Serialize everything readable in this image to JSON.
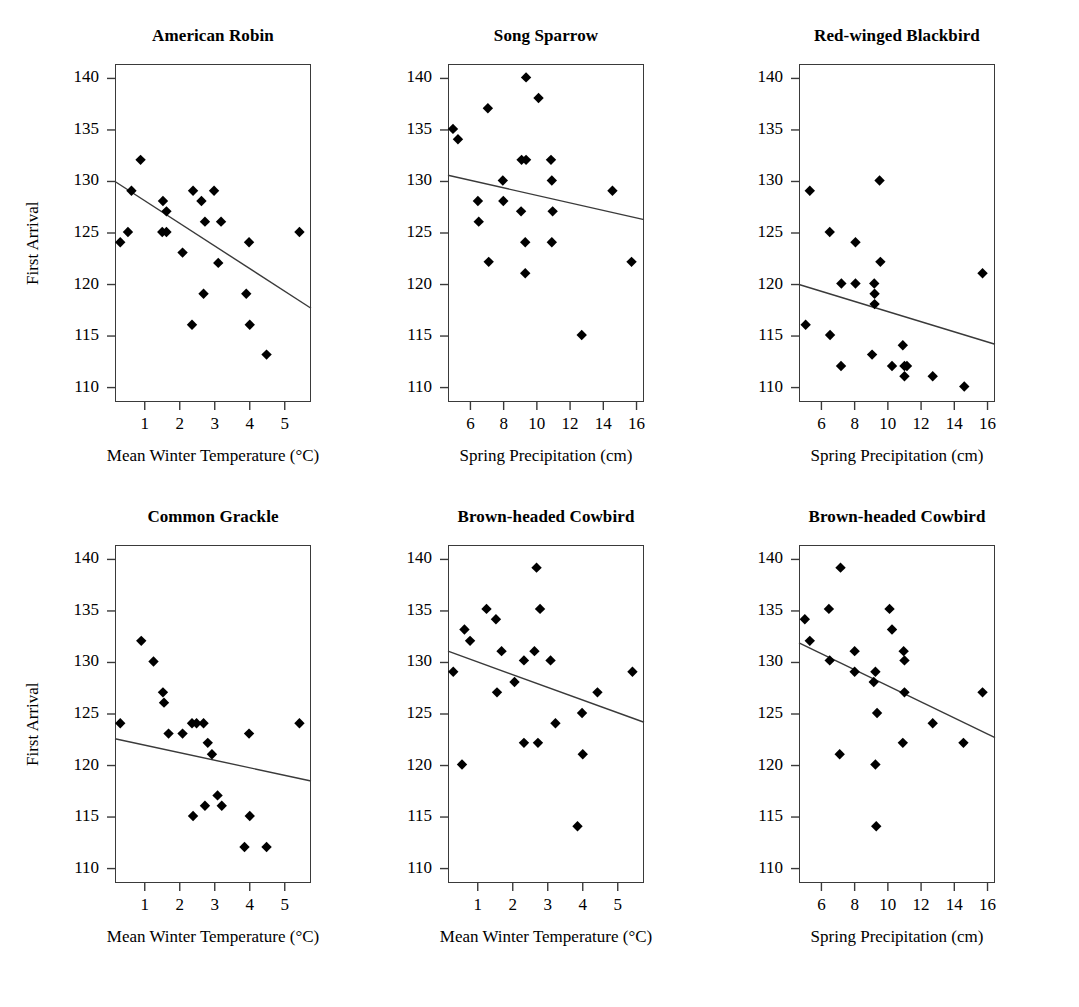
{
  "figure": {
    "ylabel": "First Arrival",
    "xlabel_temp": "Mean Winter Temperature (°C)",
    "xlabel_precip": "Spring Precipitation (cm)",
    "yticks": [
      110,
      115,
      120,
      125,
      130,
      135,
      140
    ],
    "xticks_temp": [
      1,
      2,
      3,
      4,
      5
    ],
    "xticks_precip": [
      6,
      8,
      10,
      12,
      14,
      16
    ],
    "marker_color": "#000000",
    "line_color": "#3a3a3a",
    "frame_color": "#3a3a3a"
  },
  "chart_data": [
    {
      "type": "scatter",
      "title": "American Robin",
      "xlabel": "Mean Winter Temperature (°C)",
      "ylabel": "First Arrival",
      "xlim": [
        0.15,
        5.75
      ],
      "ylim": [
        108.6,
        141.4
      ],
      "xticks": [
        1,
        2,
        3,
        4,
        5
      ],
      "yticks": [
        110,
        115,
        120,
        125,
        130,
        135,
        140
      ],
      "grid": false,
      "legend": "none",
      "points": [
        [
          0.3,
          124.1
        ],
        [
          0.52,
          125.1
        ],
        [
          0.62,
          129.1
        ],
        [
          0.88,
          132.1
        ],
        [
          1.5,
          125.1
        ],
        [
          1.52,
          128.1
        ],
        [
          1.62,
          127.1
        ],
        [
          1.62,
          125.1
        ],
        [
          2.08,
          123.1
        ],
        [
          2.35,
          116.1
        ],
        [
          2.38,
          129.1
        ],
        [
          2.62,
          128.1
        ],
        [
          2.68,
          119.1
        ],
        [
          2.72,
          126.1
        ],
        [
          2.98,
          129.1
        ],
        [
          3.1,
          122.1
        ],
        [
          3.18,
          126.1
        ],
        [
          3.9,
          119.1
        ],
        [
          3.98,
          124.1
        ],
        [
          4.0,
          116.1
        ],
        [
          4.48,
          113.2
        ],
        [
          5.42,
          125.1
        ]
      ],
      "fit_line": {
        "x0": 0.15,
        "y0": 130.0,
        "x1": 5.75,
        "y1": 117.7
      }
    },
    {
      "type": "scatter",
      "title": "Song Sparrow",
      "xlabel": "Spring Precipitation (cm)",
      "ylabel": "First Arrival",
      "xlim": [
        4.65,
        16.45
      ],
      "ylim": [
        108.6,
        141.4
      ],
      "xticks": [
        6,
        8,
        10,
        12,
        14,
        16
      ],
      "yticks": [
        110,
        115,
        120,
        125,
        130,
        135,
        140
      ],
      "grid": false,
      "legend": "none",
      "points": [
        [
          4.95,
          135.1
        ],
        [
          5.25,
          134.1
        ],
        [
          6.45,
          128.1
        ],
        [
          6.5,
          126.1
        ],
        [
          7.05,
          137.1
        ],
        [
          7.1,
          122.2
        ],
        [
          7.95,
          130.1
        ],
        [
          7.98,
          128.1
        ],
        [
          9.05,
          127.1
        ],
        [
          9.08,
          132.1
        ],
        [
          9.35,
          132.1
        ],
        [
          9.3,
          124.1
        ],
        [
          9.35,
          140.1
        ],
        [
          9.3,
          121.1
        ],
        [
          10.1,
          138.1
        ],
        [
          10.85,
          132.1
        ],
        [
          10.9,
          130.1
        ],
        [
          10.95,
          127.1
        ],
        [
          10.9,
          124.1
        ],
        [
          12.7,
          115.1
        ],
        [
          14.55,
          129.1
        ],
        [
          15.7,
          122.2
        ]
      ],
      "fit_line": {
        "x0": 4.65,
        "y0": 130.6,
        "x1": 16.45,
        "y1": 126.3
      }
    },
    {
      "type": "scatter",
      "title": "Red-winged Blackbird",
      "xlabel": "Spring Precipitation (cm)",
      "ylabel": "First Arrival",
      "xlim": [
        4.65,
        16.45
      ],
      "ylim": [
        108.6,
        141.4
      ],
      "xticks": [
        6,
        8,
        10,
        12,
        14,
        16
      ],
      "yticks": [
        110,
        115,
        120,
        125,
        130,
        135,
        140
      ],
      "grid": false,
      "legend": "none",
      "points": [
        [
          5.3,
          129.1
        ],
        [
          5.05,
          116.1
        ],
        [
          6.5,
          125.1
        ],
        [
          6.52,
          115.1
        ],
        [
          7.2,
          120.1
        ],
        [
          7.18,
          112.1
        ],
        [
          8.05,
          124.1
        ],
        [
          8.05,
          120.1
        ],
        [
          9.05,
          113.2
        ],
        [
          9.18,
          120.1
        ],
        [
          9.2,
          119.1
        ],
        [
          9.2,
          118.1
        ],
        [
          9.5,
          130.1
        ],
        [
          9.55,
          122.2
        ],
        [
          10.25,
          112.1
        ],
        [
          10.9,
          114.1
        ],
        [
          11.0,
          112.1
        ],
        [
          11.15,
          112.1
        ],
        [
          11.0,
          111.1
        ],
        [
          12.7,
          111.1
        ],
        [
          14.6,
          110.1
        ],
        [
          15.7,
          121.1
        ]
      ],
      "fit_line": {
        "x0": 4.65,
        "y0": 120.0,
        "x1": 16.45,
        "y1": 114.2
      }
    },
    {
      "type": "scatter",
      "title": "Common Grackle",
      "xlabel": "Mean Winter Temperature (°C)",
      "ylabel": "First Arrival",
      "xlim": [
        0.15,
        5.75
      ],
      "ylim": [
        108.6,
        141.4
      ],
      "xticks": [
        1,
        2,
        3,
        4,
        5
      ],
      "yticks": [
        110,
        115,
        120,
        125,
        130,
        135,
        140
      ],
      "grid": false,
      "legend": "none",
      "points": [
        [
          0.3,
          124.1
        ],
        [
          0.9,
          132.1
        ],
        [
          1.25,
          130.1
        ],
        [
          1.52,
          127.1
        ],
        [
          1.55,
          126.1
        ],
        [
          1.68,
          123.1
        ],
        [
          2.08,
          123.1
        ],
        [
          2.35,
          124.1
        ],
        [
          2.38,
          115.1
        ],
        [
          2.48,
          124.1
        ],
        [
          2.68,
          124.1
        ],
        [
          2.72,
          116.1
        ],
        [
          2.8,
          122.2
        ],
        [
          2.92,
          121.1
        ],
        [
          3.08,
          117.1
        ],
        [
          3.2,
          116.1
        ],
        [
          3.85,
          112.1
        ],
        [
          3.98,
          123.1
        ],
        [
          4.0,
          115.1
        ],
        [
          4.48,
          112.1
        ],
        [
          5.42,
          124.1
        ]
      ],
      "fit_line": {
        "x0": 0.15,
        "y0": 122.6,
        "x1": 5.75,
        "y1": 118.5
      }
    },
    {
      "type": "scatter",
      "title": "Brown-headed Cowbird",
      "xlabel": "Mean Winter Temperature (°C)",
      "ylabel": "First Arrival",
      "xlim": [
        0.15,
        5.75
      ],
      "ylim": [
        108.6,
        141.4
      ],
      "xticks": [
        1,
        2,
        3,
        4,
        5
      ],
      "yticks": [
        110,
        115,
        120,
        125,
        130,
        135,
        140
      ],
      "grid": false,
      "legend": "none",
      "points": [
        [
          0.3,
          129.1
        ],
        [
          0.55,
          120.1
        ],
        [
          0.62,
          133.2
        ],
        [
          0.78,
          132.1
        ],
        [
          1.25,
          135.2
        ],
        [
          1.52,
          134.2
        ],
        [
          1.55,
          127.1
        ],
        [
          1.68,
          131.1
        ],
        [
          2.05,
          128.1
        ],
        [
          2.32,
          130.2
        ],
        [
          2.32,
          122.2
        ],
        [
          2.62,
          131.1
        ],
        [
          2.68,
          139.2
        ],
        [
          2.72,
          122.2
        ],
        [
          2.78,
          135.2
        ],
        [
          3.08,
          130.2
        ],
        [
          3.22,
          124.1
        ],
        [
          3.85,
          114.1
        ],
        [
          3.98,
          125.1
        ],
        [
          4.0,
          121.1
        ],
        [
          4.42,
          127.1
        ],
        [
          5.42,
          129.1
        ]
      ],
      "fit_line": {
        "x0": 0.15,
        "y0": 131.1,
        "x1": 5.75,
        "y1": 124.2
      }
    },
    {
      "type": "scatter",
      "title": "Brown-headed Cowbird",
      "xlabel": "Spring Precipitation (cm)",
      "ylabel": "First Arrival",
      "xlim": [
        4.65,
        16.45
      ],
      "ylim": [
        108.6,
        141.4
      ],
      "xticks": [
        6,
        8,
        10,
        12,
        14,
        16
      ],
      "yticks": [
        110,
        115,
        120,
        125,
        130,
        135,
        140
      ],
      "grid": false,
      "legend": "none",
      "points": [
        [
          5.0,
          134.2
        ],
        [
          5.3,
          132.1
        ],
        [
          6.45,
          135.2
        ],
        [
          6.5,
          130.2
        ],
        [
          7.15,
          139.2
        ],
        [
          7.1,
          121.1
        ],
        [
          8.0,
          131.1
        ],
        [
          8.0,
          129.1
        ],
        [
          9.15,
          128.1
        ],
        [
          9.25,
          129.1
        ],
        [
          9.25,
          120.1
        ],
        [
          9.35,
          125.1
        ],
        [
          9.3,
          114.1
        ],
        [
          10.1,
          135.2
        ],
        [
          10.25,
          133.2
        ],
        [
          10.95,
          131.1
        ],
        [
          11.0,
          130.2
        ],
        [
          11.0,
          127.1
        ],
        [
          10.9,
          122.2
        ],
        [
          12.7,
          124.1
        ],
        [
          14.55,
          122.2
        ],
        [
          15.7,
          127.1
        ]
      ],
      "fit_line": {
        "x0": 4.65,
        "y0": 131.9,
        "x1": 16.45,
        "y1": 122.7
      }
    }
  ]
}
